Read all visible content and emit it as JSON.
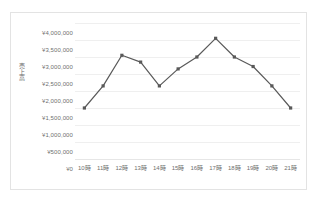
{
  "chart_data": {
    "type": "line",
    "title": "",
    "xlabel": "",
    "ylabel": "売上高",
    "categories": [
      "10時",
      "11時",
      "12時",
      "13時",
      "14時",
      "15時",
      "16時",
      "17時",
      "18時",
      "19時",
      "20時",
      "21時"
    ],
    "series": [
      {
        "name": "売上高",
        "values": [
          1500000,
          2150000,
          3050000,
          2850000,
          2150000,
          2650000,
          3000000,
          3550000,
          3000000,
          2720000,
          2150000,
          1500000
        ]
      }
    ],
    "ylim": [
      0,
      4000000
    ],
    "ytick_values": [
      0,
      500000,
      1000000,
      1500000,
      2000000,
      2500000,
      3000000,
      3500000,
      4000000
    ],
    "ytick_labels": [
      "¥0",
      "¥500,000",
      "¥1,000,000",
      "¥1,500,000",
      "¥2,000,000",
      "¥2,500,000",
      "¥3,000,000",
      "¥3,500,000",
      "¥4,000,000"
    ],
    "grid": true,
    "legend": false,
    "legend_position": "none",
    "line_color": "#595959",
    "marker_color": "#595959",
    "grid_color": "#efefef",
    "border_color": "#e3e3e3",
    "tick_label_color": "#6f6f6f",
    "background_color": "#ffffff"
  }
}
